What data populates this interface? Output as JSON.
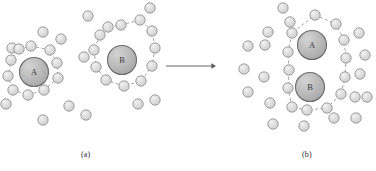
{
  "figure": {
    "background_color": "#ffffff",
    "panel_labels": {
      "left": "(a)",
      "right": "(b)"
    },
    "solute_labels": {
      "a": "A",
      "b": "B"
    },
    "colors": {
      "solvent_fill": "#dcdcdc",
      "solvent_stroke": "#8a8a8a",
      "solute_fill": "#b8b8b8",
      "solute_stroke": "#6b6b6b",
      "shell_stroke": "#9a9a9a",
      "arrow_color": "#555555",
      "label_color": "#2b2b2b"
    },
    "geometry": {
      "solvent_radius": 5.2,
      "solute_radius": 14.5,
      "shell_dash": "3,2.4",
      "shell_width": 0.9
    },
    "arrow": {
      "x1": 166,
      "y1": 66,
      "x2": 216,
      "y2": 66,
      "head_size": 4.6
    }
  },
  "chart_data": {
    "type": "scatter",
    "title": "",
    "xlabel": "",
    "ylabel": "",
    "panels": [
      {
        "label": "(a)",
        "description": "Species A and species B each enclosed in its own dashed solvation shell, with free solvent molecules between and around them.",
        "solutes": [
          {
            "name": "A",
            "cx": 34,
            "cy": 72,
            "r": 14.5
          },
          {
            "name": "B",
            "cx": 122,
            "cy": 60,
            "r": 14.5
          }
        ],
        "shells": [
          {
            "owner": "A",
            "vertices": [
              [
                31,
                46
              ],
              [
                50,
                50
              ],
              [
                57,
                63
              ],
              [
                58,
                78
              ],
              [
                44,
                90
              ],
              [
                28,
                95
              ],
              [
                13,
                90
              ],
              [
                8,
                76
              ],
              [
                11,
                60
              ],
              [
                19,
                49
              ]
            ]
          },
          {
            "owner": "B",
            "vertices": [
              [
                121,
                25
              ],
              [
                140,
                20
              ],
              [
                152,
                31
              ],
              [
                155,
                48
              ],
              [
                152,
                66
              ],
              [
                141,
                81
              ],
              [
                124,
                86
              ],
              [
                106,
                80
              ],
              [
                96,
                67
              ],
              [
                94,
                50
              ],
              [
                100,
                35
              ],
              [
                108,
                27
              ]
            ]
          }
        ],
        "shell_solvents_a": [
          [
            31,
            46
          ],
          [
            50,
            50
          ],
          [
            57,
            63
          ],
          [
            58,
            78
          ],
          [
            44,
            90
          ],
          [
            28,
            95
          ],
          [
            13,
            90
          ],
          [
            8,
            76
          ],
          [
            11,
            60
          ],
          [
            19,
            49
          ]
        ],
        "shell_solvents_b": [
          [
            121,
            25
          ],
          [
            140,
            20
          ],
          [
            152,
            31
          ],
          [
            155,
            48
          ],
          [
            152,
            66
          ],
          [
            141,
            81
          ],
          [
            124,
            86
          ],
          [
            106,
            80
          ],
          [
            96,
            67
          ],
          [
            94,
            50
          ],
          [
            100,
            35
          ],
          [
            108,
            27
          ]
        ],
        "free_solvents": [
          [
            43,
            32
          ],
          [
            61,
            39
          ],
          [
            12,
            48
          ],
          [
            88,
            16
          ],
          [
            69,
            106
          ],
          [
            43,
            120
          ],
          [
            86,
            115
          ],
          [
            138,
            104
          ],
          [
            155,
            100
          ],
          [
            84,
            57
          ],
          [
            6,
            104
          ],
          [
            150,
            8
          ]
        ]
      },
      {
        "label": "(b)",
        "description": "Species A and species B share a single dashed solvation shell; displaced solvent molecules are scattered in the surrounding bulk.",
        "solutes": [
          {
            "name": "A",
            "cx": 312,
            "cy": 45,
            "r": 14.5
          },
          {
            "name": "B",
            "cx": 310,
            "cy": 87,
            "r": 14.5
          }
        ],
        "shells": [
          {
            "owner": "A+B",
            "vertices": [
              [
                315,
                15
              ],
              [
                336,
                24
              ],
              [
                344,
                40
              ],
              [
                346,
                58
              ],
              [
                345,
                77
              ],
              [
                341,
                94
              ],
              [
                327,
                108
              ],
              [
                307,
                110
              ],
              [
                292,
                107
              ],
              [
                288,
                88
              ],
              [
                289,
                70
              ],
              [
                288,
                52
              ],
              [
                292,
                33
              ]
            ]
          }
        ],
        "shell_solvents": [
          [
            315,
            15
          ],
          [
            336,
            24
          ],
          [
            344,
            40
          ],
          [
            346,
            58
          ],
          [
            345,
            77
          ],
          [
            341,
            94
          ],
          [
            327,
            108
          ],
          [
            307,
            110
          ],
          [
            292,
            107
          ],
          [
            288,
            88
          ],
          [
            289,
            70
          ],
          [
            288,
            52
          ],
          [
            292,
            33
          ]
        ],
        "free_solvents": [
          [
            290,
            22
          ],
          [
            268,
            32
          ],
          [
            248,
            46
          ],
          [
            244,
            69
          ],
          [
            248,
            92
          ],
          [
            265,
            45
          ],
          [
            264,
            77
          ],
          [
            270,
            103
          ],
          [
            273,
            124
          ],
          [
            304,
            126
          ],
          [
            359,
            33
          ],
          [
            365,
            55
          ],
          [
            360,
            74
          ],
          [
            355,
            97
          ],
          [
            367,
            97
          ],
          [
            334,
            118
          ],
          [
            356,
            118
          ],
          [
            283,
            8
          ]
        ]
      }
    ]
  }
}
